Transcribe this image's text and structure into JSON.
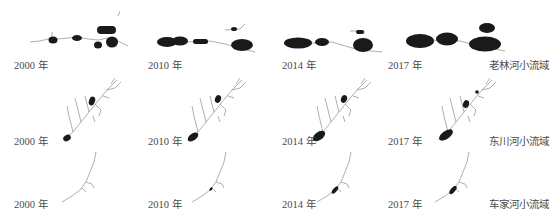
{
  "figure": {
    "type": "multi-panel watershed map comparison",
    "years": [
      "2000 年",
      "2010 年",
      "2014 年",
      "2017 年"
    ],
    "rows": [
      {
        "basin": "老林河小流域",
        "year_labels": [
          "2000 年",
          "2010 年",
          "2014 年",
          "2017 年"
        ]
      },
      {
        "basin": "东川河小流域",
        "year_labels": [
          "2000 年",
          "2010 年",
          "2014 年",
          "2017 年"
        ]
      },
      {
        "basin": "车家河小流域",
        "year_labels": [
          "2000 年",
          "2010 年",
          "2014 年",
          "2017 年"
        ]
      }
    ],
    "caption": "",
    "colors": {
      "water_body": "#1a1a1a",
      "stream": "#9a9a9a",
      "label": "#4a4a4a",
      "background": "#ffffff"
    }
  }
}
